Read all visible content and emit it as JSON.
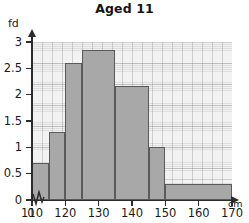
{
  "chart_data": {
    "type": "bar",
    "title": "Aged 11",
    "xlabel": "cm",
    "ylabel": "fd",
    "xlim": [
      110,
      170
    ],
    "ylim": [
      0,
      3
    ],
    "grid": true,
    "legend": "none",
    "axis_break_x": true,
    "x_origin_label": "0",
    "xticks": [
      0,
      110,
      120,
      130,
      140,
      150,
      160,
      170
    ],
    "xtick_labels": [
      "0",
      "110",
      "120",
      "130",
      "140",
      "150",
      "160",
      "170"
    ],
    "yticks": [
      0,
      0.5,
      1,
      1.5,
      2,
      2.5,
      3
    ],
    "ytick_labels": [
      "0",
      "0.5",
      "1",
      "1.5",
      "2",
      "2.5",
      "3"
    ],
    "bars": [
      {
        "label": "110-115",
        "start": 110,
        "end": 115,
        "value": 0.7
      },
      {
        "label": "115-120",
        "start": 115,
        "end": 120,
        "value": 1.3
      },
      {
        "label": "120-125",
        "start": 120,
        "end": 125,
        "value": 2.6
      },
      {
        "label": "125-135",
        "start": 125,
        "end": 135,
        "value": 2.85
      },
      {
        "label": "135-145",
        "start": 135,
        "end": 145,
        "value": 2.17
      },
      {
        "label": "145-150",
        "start": 145,
        "end": 150,
        "value": 1.0
      },
      {
        "label": "150-170",
        "start": 150,
        "end": 170,
        "value": 0.3
      }
    ],
    "categories": [
      "110-115",
      "115-120",
      "120-125",
      "125-135",
      "135-145",
      "145-150",
      "150-170"
    ],
    "values": [
      0.7,
      1.3,
      2.6,
      2.85,
      2.17,
      1.0,
      0.3
    ],
    "colors": {
      "bar_fill": "#a8a8a8",
      "bar_stroke": "#5a5a5a",
      "axis": "#2b2b2b",
      "grid": "#969696",
      "plot_background": "#f2f2f2",
      "text": "#1a1a1a"
    }
  }
}
